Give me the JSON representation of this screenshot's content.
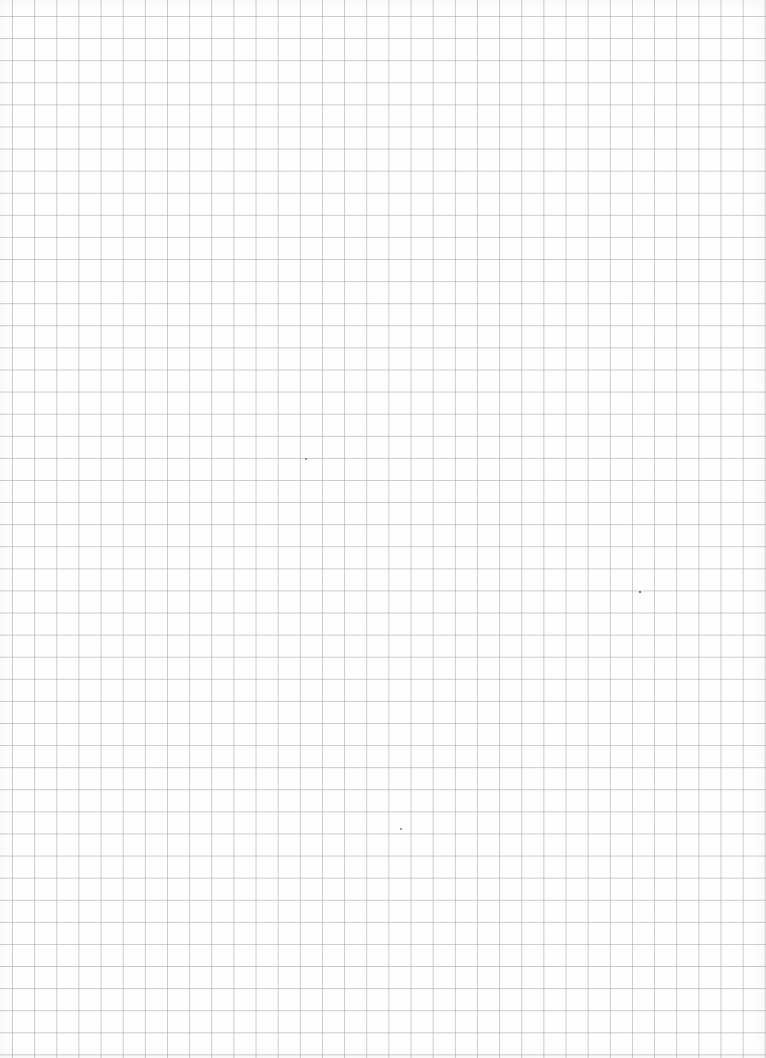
{
  "page": {
    "type": "graph-paper",
    "background_color": "#fefefe",
    "grid": {
      "line_color": "#c4c4c4",
      "cell_size_px": 22,
      "columns": 35,
      "rows": 48
    }
  },
  "marks": [
    {
      "name": "speck",
      "x": 640,
      "y": 592
    },
    {
      "name": "speck",
      "x": 401,
      "y": 829
    },
    {
      "name": "speck",
      "x": 305,
      "y": 458
    }
  ]
}
